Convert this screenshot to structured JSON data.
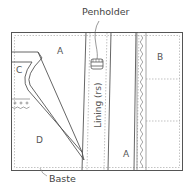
{
  "diagram": {
    "callouts": {
      "penholder": "Penholder",
      "baste": "Baste"
    },
    "panel_labels": {
      "a_top": "A",
      "a_bottom": "A",
      "b": "B",
      "c": "C",
      "d": "D"
    },
    "lining_label": "Lining (rs)",
    "colors": {
      "line": "#555555",
      "stitch": "#999999",
      "background": "#ffffff"
    }
  }
}
